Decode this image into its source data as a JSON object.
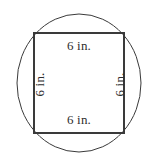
{
  "figure": {
    "type": "geometry-diagram",
    "background_color": "#ffffff",
    "circle": {
      "name": "circumscribed-circle",
      "center_x": 79,
      "center_y": 83,
      "radius_x": 62,
      "radius_y": 69,
      "stroke_color": "#3a3a3a",
      "stroke_width": 1
    },
    "square": {
      "name": "inscribed-square",
      "x": 34,
      "y": 33,
      "width": 90,
      "height": 100,
      "stroke_color": "#3a3a3a",
      "stroke_width": 2,
      "fill": "none"
    },
    "labels": {
      "top": "6 in.",
      "bottom": "6 in.",
      "left": "6 in.",
      "right": "6 in."
    },
    "label_color": "#2e2e2e"
  }
}
